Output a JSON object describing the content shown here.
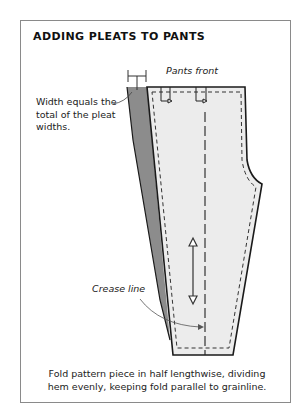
{
  "figure": {
    "title": "ADDING PLEATS TO PANTS",
    "labels": {
      "pants_front": "Pants front",
      "width_note": "Width equals the total of the pleat widths.",
      "crease_line": "Crease line"
    },
    "caption": "Fold pattern piece in half lengthwise, dividing hem evenly, keeping fold parallel to grainline.",
    "colors": {
      "frame_border": "#8a8a8a",
      "pants_fill": "#ebebeb",
      "added_wedge_fill": "#8c8c8c",
      "outline": "#1a1a1a"
    }
  }
}
